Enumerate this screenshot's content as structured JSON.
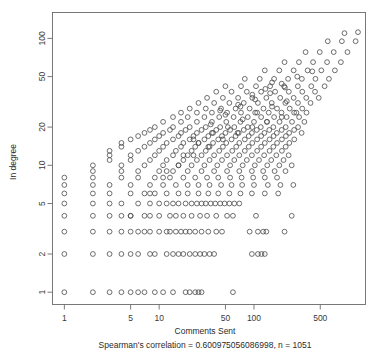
{
  "chart_data": {
    "type": "scatter",
    "title": "",
    "xlabel": "Comments Sent",
    "ylabel": "In degree",
    "xscale": "log",
    "yscale": "log",
    "xlim": [
      0.75,
      1500
    ],
    "ylim": [
      0.8,
      160
    ],
    "grid": false,
    "legend": null,
    "marker": "open-circle",
    "annotation": "Spearman's correlation = 0.600975056086998, n = 1051",
    "correlation": 0.600975056086998,
    "n": 1051,
    "xticks": [
      1,
      5,
      10,
      50,
      100,
      500
    ],
    "xtick_labels": [
      "1",
      "5",
      "10",
      "50",
      "100",
      "500"
    ],
    "yticks": [
      1,
      2,
      5,
      10,
      20,
      50,
      100
    ],
    "ytick_labels": [
      "1",
      "2",
      "5",
      "10",
      "20",
      "50",
      "100"
    ],
    "points": [
      [
        1,
        1
      ],
      [
        2,
        1
      ],
      [
        3,
        1
      ],
      [
        4,
        1
      ],
      [
        5,
        1
      ],
      [
        6,
        1
      ],
      [
        7,
        1
      ],
      [
        9,
        1
      ],
      [
        11,
        1
      ],
      [
        14,
        1
      ],
      [
        19,
        1
      ],
      [
        21,
        1
      ],
      [
        24,
        1
      ],
      [
        26,
        1
      ],
      [
        28,
        1
      ],
      [
        60,
        1
      ],
      [
        1,
        2
      ],
      [
        2,
        2
      ],
      [
        3,
        2
      ],
      [
        4,
        2
      ],
      [
        5,
        2
      ],
      [
        6,
        2
      ],
      [
        8,
        2
      ],
      [
        9,
        2
      ],
      [
        12,
        2
      ],
      [
        14,
        2
      ],
      [
        16,
        2
      ],
      [
        18,
        2
      ],
      [
        21,
        2
      ],
      [
        24,
        2
      ],
      [
        27,
        2
      ],
      [
        30,
        2
      ],
      [
        34,
        2
      ],
      [
        38,
        2
      ],
      [
        95,
        2
      ],
      [
        110,
        2
      ],
      [
        120,
        2
      ],
      [
        130,
        2
      ],
      [
        1,
        3
      ],
      [
        2,
        3
      ],
      [
        3,
        3
      ],
      [
        4,
        3
      ],
      [
        5,
        3
      ],
      [
        6,
        3
      ],
      [
        7,
        3
      ],
      [
        8,
        3
      ],
      [
        10,
        3
      ],
      [
        12,
        3
      ],
      [
        13,
        3
      ],
      [
        15,
        3
      ],
      [
        17,
        3
      ],
      [
        19,
        3
      ],
      [
        21,
        3
      ],
      [
        24,
        3
      ],
      [
        28,
        3
      ],
      [
        33,
        3
      ],
      [
        40,
        3
      ],
      [
        46,
        3
      ],
      [
        90,
        3
      ],
      [
        110,
        3
      ],
      [
        125,
        3
      ],
      [
        135,
        3
      ],
      [
        210,
        3
      ],
      [
        1,
        4
      ],
      [
        2,
        4
      ],
      [
        3,
        4
      ],
      [
        4,
        4
      ],
      [
        5,
        4
      ],
      [
        7,
        4
      ],
      [
        8,
        4
      ],
      [
        10,
        4
      ],
      [
        13,
        4
      ],
      [
        15,
        4
      ],
      [
        18,
        4
      ],
      [
        22,
        4
      ],
      [
        27,
        4
      ],
      [
        32,
        4
      ],
      [
        40,
        4
      ],
      [
        52,
        4
      ],
      [
        60,
        4
      ],
      [
        105,
        4
      ],
      [
        250,
        4
      ],
      [
        1,
        5
      ],
      [
        2,
        5
      ],
      [
        3,
        5
      ],
      [
        4,
        5
      ],
      [
        6,
        5
      ],
      [
        8,
        5
      ],
      [
        10,
        5
      ],
      [
        12,
        5
      ],
      [
        14,
        5
      ],
      [
        16,
        5
      ],
      [
        19,
        5
      ],
      [
        22,
        5
      ],
      [
        25,
        5
      ],
      [
        28,
        5
      ],
      [
        31,
        5
      ],
      [
        35,
        5
      ],
      [
        39,
        5
      ],
      [
        44,
        5
      ],
      [
        49,
        5
      ],
      [
        55,
        5
      ],
      [
        62,
        5
      ],
      [
        70,
        5
      ],
      [
        1,
        6
      ],
      [
        2,
        6
      ],
      [
        3,
        6
      ],
      [
        5,
        6
      ],
      [
        7,
        6
      ],
      [
        9,
        6
      ],
      [
        12,
        6
      ],
      [
        16,
        6
      ],
      [
        20,
        6
      ],
      [
        26,
        6
      ],
      [
        33,
        6
      ],
      [
        42,
        6
      ],
      [
        55,
        6
      ],
      [
        72,
        6
      ],
      [
        95,
        6
      ],
      [
        130,
        6
      ],
      [
        180,
        6
      ],
      [
        1,
        7
      ],
      [
        2,
        7
      ],
      [
        3,
        7
      ],
      [
        5,
        7
      ],
      [
        8,
        7
      ],
      [
        11,
        7
      ],
      [
        15,
        7
      ],
      [
        20,
        7
      ],
      [
        26,
        7
      ],
      [
        34,
        7
      ],
      [
        45,
        7
      ],
      [
        58,
        7
      ],
      [
        75,
        7
      ],
      [
        100,
        7
      ],
      [
        140,
        7
      ],
      [
        190,
        7
      ],
      [
        260,
        7
      ],
      [
        1,
        8
      ],
      [
        2,
        8
      ],
      [
        4,
        8
      ],
      [
        6,
        8
      ],
      [
        9,
        8
      ],
      [
        13,
        8
      ],
      [
        18,
        8
      ],
      [
        24,
        8
      ],
      [
        32,
        8
      ],
      [
        42,
        8
      ],
      [
        56,
        8
      ],
      [
        74,
        8
      ],
      [
        98,
        8
      ],
      [
        130,
        8
      ],
      [
        175,
        8
      ],
      [
        2,
        9
      ],
      [
        4,
        9
      ],
      [
        6,
        9
      ],
      [
        10,
        9
      ],
      [
        14,
        9
      ],
      [
        20,
        9
      ],
      [
        28,
        9
      ],
      [
        38,
        9
      ],
      [
        52,
        9
      ],
      [
        70,
        9
      ],
      [
        95,
        9
      ],
      [
        125,
        9
      ],
      [
        165,
        9
      ],
      [
        215,
        9
      ],
      [
        2,
        10
      ],
      [
        4,
        10
      ],
      [
        7,
        10
      ],
      [
        11,
        10
      ],
      [
        16,
        10
      ],
      [
        22,
        10
      ],
      [
        30,
        10
      ],
      [
        41,
        10
      ],
      [
        56,
        10
      ],
      [
        76,
        10
      ],
      [
        102,
        10
      ],
      [
        138,
        10
      ],
      [
        185,
        10
      ],
      [
        250,
        10
      ],
      [
        3,
        11
      ],
      [
        5,
        11
      ],
      [
        8,
        11
      ],
      [
        12,
        11
      ],
      [
        18,
        11
      ],
      [
        25,
        11
      ],
      [
        34,
        11
      ],
      [
        46,
        11
      ],
      [
        62,
        11
      ],
      [
        84,
        11
      ],
      [
        113,
        11
      ],
      [
        152,
        11
      ],
      [
        205,
        11
      ],
      [
        3,
        12
      ],
      [
        5,
        12
      ],
      [
        9,
        12
      ],
      [
        14,
        12
      ],
      [
        20,
        12
      ],
      [
        28,
        12
      ],
      [
        38,
        12
      ],
      [
        52,
        12
      ],
      [
        70,
        12
      ],
      [
        95,
        12
      ],
      [
        128,
        12
      ],
      [
        172,
        12
      ],
      [
        232,
        12
      ],
      [
        3,
        13
      ],
      [
        6,
        13
      ],
      [
        10,
        13
      ],
      [
        15,
        13
      ],
      [
        22,
        13
      ],
      [
        31,
        13
      ],
      [
        43,
        13
      ],
      [
        59,
        13
      ],
      [
        80,
        13
      ],
      [
        108,
        13
      ],
      [
        146,
        13
      ],
      [
        197,
        13
      ],
      [
        4,
        14
      ],
      [
        7,
        14
      ],
      [
        11,
        14
      ],
      [
        17,
        14
      ],
      [
        24,
        14
      ],
      [
        34,
        14
      ],
      [
        47,
        14
      ],
      [
        65,
        14
      ],
      [
        88,
        14
      ],
      [
        119,
        14
      ],
      [
        160,
        14
      ],
      [
        216,
        14
      ],
      [
        4,
        15
      ],
      [
        8,
        15
      ],
      [
        12,
        15
      ],
      [
        18,
        15
      ],
      [
        26,
        15
      ],
      [
        37,
        15
      ],
      [
        51,
        15
      ],
      [
        70,
        15
      ],
      [
        96,
        15
      ],
      [
        130,
        15
      ],
      [
        175,
        15
      ],
      [
        236,
        15
      ],
      [
        5,
        16
      ],
      [
        9,
        16
      ],
      [
        14,
        16
      ],
      [
        21,
        16
      ],
      [
        30,
        16
      ],
      [
        42,
        16
      ],
      [
        58,
        16
      ],
      [
        80,
        16
      ],
      [
        108,
        16
      ],
      [
        146,
        16
      ],
      [
        197,
        16
      ],
      [
        266,
        16
      ],
      [
        6,
        17
      ],
      [
        10,
        17
      ],
      [
        16,
        17
      ],
      [
        23,
        17
      ],
      [
        33,
        17
      ],
      [
        46,
        17
      ],
      [
        64,
        17
      ],
      [
        88,
        17
      ],
      [
        119,
        17
      ],
      [
        161,
        17
      ],
      [
        217,
        17
      ],
      [
        7,
        18
      ],
      [
        11,
        18
      ],
      [
        17,
        18
      ],
      [
        25,
        18
      ],
      [
        36,
        18
      ],
      [
        50,
        18
      ],
      [
        69,
        18
      ],
      [
        95,
        18
      ],
      [
        129,
        18
      ],
      [
        174,
        18
      ],
      [
        235,
        18
      ],
      [
        318,
        18
      ],
      [
        8,
        19
      ],
      [
        13,
        19
      ],
      [
        19,
        19
      ],
      [
        28,
        19
      ],
      [
        40,
        19
      ],
      [
        56,
        19
      ],
      [
        78,
        19
      ],
      [
        107,
        19
      ],
      [
        145,
        19
      ],
      [
        196,
        19
      ],
      [
        265,
        19
      ],
      [
        9,
        20
      ],
      [
        14,
        20
      ],
      [
        21,
        20
      ],
      [
        31,
        20
      ],
      [
        44,
        20
      ],
      [
        62,
        20
      ],
      [
        86,
        20
      ],
      [
        118,
        20
      ],
      [
        160,
        20
      ],
      [
        216,
        20
      ],
      [
        292,
        20
      ],
      [
        11,
        22
      ],
      [
        17,
        22
      ],
      [
        25,
        22
      ],
      [
        36,
        22
      ],
      [
        51,
        22
      ],
      [
        72,
        22
      ],
      [
        100,
        22
      ],
      [
        137,
        22
      ],
      [
        186,
        22
      ],
      [
        252,
        22
      ],
      [
        340,
        22
      ],
      [
        14,
        24
      ],
      [
        20,
        24
      ],
      [
        30,
        24
      ],
      [
        43,
        24
      ],
      [
        61,
        24
      ],
      [
        86,
        24
      ],
      [
        119,
        24
      ],
      [
        163,
        24
      ],
      [
        221,
        24
      ],
      [
        299,
        24
      ],
      [
        17,
        26
      ],
      [
        25,
        26
      ],
      [
        36,
        26
      ],
      [
        52,
        26
      ],
      [
        73,
        26
      ],
      [
        103,
        26
      ],
      [
        143,
        26
      ],
      [
        195,
        26
      ],
      [
        265,
        26
      ],
      [
        358,
        26
      ],
      [
        21,
        28
      ],
      [
        31,
        28
      ],
      [
        45,
        28
      ],
      [
        64,
        28
      ],
      [
        90,
        28
      ],
      [
        126,
        28
      ],
      [
        175,
        28
      ],
      [
        238,
        28
      ],
      [
        323,
        28
      ],
      [
        26,
        31
      ],
      [
        38,
        31
      ],
      [
        55,
        31
      ],
      [
        78,
        31
      ],
      [
        110,
        31
      ],
      [
        154,
        31
      ],
      [
        214,
        31
      ],
      [
        291,
        31
      ],
      [
        395,
        31
      ],
      [
        32,
        34
      ],
      [
        47,
        34
      ],
      [
        68,
        34
      ],
      [
        96,
        34
      ],
      [
        135,
        34
      ],
      [
        189,
        34
      ],
      [
        262,
        34
      ],
      [
        356,
        34
      ],
      [
        482,
        34
      ],
      [
        40,
        38
      ],
      [
        58,
        38
      ],
      [
        84,
        38
      ],
      [
        119,
        38
      ],
      [
        167,
        38
      ],
      [
        233,
        38
      ],
      [
        323,
        38
      ],
      [
        440,
        38
      ],
      [
        50,
        42
      ],
      [
        73,
        42
      ],
      [
        105,
        42
      ],
      [
        148,
        42
      ],
      [
        208,
        42
      ],
      [
        290,
        42
      ],
      [
        402,
        42
      ],
      [
        556,
        42
      ],
      [
        80,
        48
      ],
      [
        115,
        48
      ],
      [
        163,
        48
      ],
      [
        229,
        48
      ],
      [
        320,
        48
      ],
      [
        445,
        48
      ],
      [
        617,
        48
      ],
      [
        130,
        56
      ],
      [
        185,
        56
      ],
      [
        262,
        56
      ],
      [
        368,
        56
      ],
      [
        513,
        56
      ],
      [
        713,
        56
      ],
      [
        210,
        65
      ],
      [
        298,
        65
      ],
      [
        420,
        65
      ],
      [
        590,
        65
      ],
      [
        825,
        65
      ],
      [
        350,
        78
      ],
      [
        494,
        78
      ],
      [
        693,
        78
      ],
      [
        968,
        78
      ],
      [
        600,
        95
      ],
      [
        845,
        95
      ],
      [
        1180,
        95
      ],
      [
        900,
        110
      ],
      [
        1250,
        112
      ],
      [
        155,
        45
      ],
      [
        68,
        30
      ],
      [
        44,
        27
      ],
      [
        96,
        36
      ],
      [
        132,
        40
      ],
      [
        196,
        44
      ],
      [
        286,
        50
      ],
      [
        412,
        55
      ],
      [
        23,
        16
      ],
      [
        35,
        21
      ],
      [
        50,
        25
      ],
      [
        72,
        29
      ],
      [
        103,
        33
      ],
      [
        148,
        37
      ],
      [
        212,
        41
      ],
      [
        12,
        9
      ],
      [
        18,
        12
      ],
      [
        26,
        15
      ],
      [
        37,
        18
      ],
      [
        53,
        20
      ],
      [
        76,
        23
      ],
      [
        108,
        26
      ],
      [
        155,
        29
      ],
      [
        222,
        32
      ],
      [
        5,
        4
      ],
      [
        8,
        6
      ],
      [
        11,
        8
      ],
      [
        16,
        10
      ],
      [
        23,
        12
      ],
      [
        33,
        14
      ],
      [
        47,
        16
      ],
      [
        67,
        18
      ],
      [
        96,
        20
      ],
      [
        137,
        22
      ],
      [
        196,
        24
      ],
      [
        280,
        26
      ]
    ]
  },
  "meta": {
    "x_axis_title": "Comments Sent",
    "y_axis_title": "In degree",
    "caption": "Spearman's correlation = 0.600975056086998, n = 1051"
  },
  "colors": {
    "background": "#ffffff",
    "axis": "#6b6b6b",
    "marker": "#4a4a4a",
    "text": "#2b2b2b"
  }
}
